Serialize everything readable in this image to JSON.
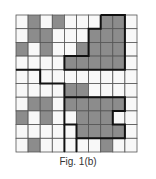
{
  "figure": {
    "caption": "Fig. 1(b)",
    "rows": 10,
    "cols": 10,
    "colors": {
      "filled": "#8c8c8c",
      "empty": "#f8f8f8",
      "grid": "#555555",
      "boundary": "#111111"
    },
    "grid": [
      [
        0,
        1,
        0,
        1,
        0,
        0,
        0,
        1,
        1,
        0
      ],
      [
        0,
        1,
        1,
        0,
        0,
        0,
        1,
        1,
        1,
        0
      ],
      [
        1,
        0,
        1,
        0,
        0,
        1,
        1,
        1,
        1,
        0
      ],
      [
        0,
        0,
        0,
        0,
        1,
        1,
        1,
        1,
        1,
        0
      ],
      [
        0,
        0,
        0,
        0,
        0,
        0,
        0,
        0,
        0,
        0
      ],
      [
        0,
        0,
        0,
        0,
        1,
        1,
        0,
        0,
        0,
        0
      ],
      [
        0,
        1,
        1,
        0,
        1,
        1,
        1,
        1,
        1,
        0
      ],
      [
        1,
        0,
        1,
        0,
        0,
        1,
        1,
        1,
        0,
        0
      ],
      [
        0,
        0,
        0,
        0,
        0,
        1,
        1,
        1,
        1,
        0
      ],
      [
        0,
        1,
        0,
        0,
        0,
        0,
        0,
        1,
        0,
        0
      ]
    ],
    "boundaries": [
      [
        [
          7,
          0
        ],
        [
          9,
          0
        ],
        [
          9,
          4
        ],
        [
          4,
          4
        ],
        [
          4,
          3
        ],
        [
          6,
          3
        ],
        [
          6,
          1
        ],
        [
          7,
          1
        ],
        [
          7,
          0
        ]
      ],
      [
        [
          0,
          4
        ],
        [
          2,
          4
        ],
        [
          2,
          5
        ],
        [
          4,
          5
        ],
        [
          4,
          6
        ],
        [
          6,
          6
        ],
        [
          6,
          6
        ],
        [
          9,
          6
        ],
        [
          9,
          7
        ],
        [
          8,
          7
        ],
        [
          8,
          8
        ],
        [
          9,
          8
        ],
        [
          9,
          9
        ],
        [
          5,
          9
        ],
        [
          5,
          8
        ],
        [
          4,
          8
        ],
        [
          4,
          6
        ]
      ],
      [
        [
          5,
          9
        ],
        [
          5,
          10
        ]
      ],
      [
        [
          4,
          8
        ],
        [
          4,
          10
        ]
      ]
    ]
  }
}
